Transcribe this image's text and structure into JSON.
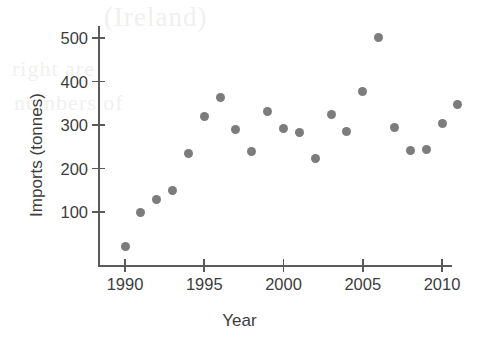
{
  "chart_data": {
    "type": "scatter",
    "title": "",
    "xlabel": "Year",
    "ylabel": "Imports (tonnes)",
    "xlim": [
      1989.0,
      2012.0
    ],
    "ylim": [
      0,
      540
    ],
    "xticks": [
      1990,
      1995,
      2000,
      2005,
      2010
    ],
    "yticks": [
      100,
      200,
      300,
      400,
      500
    ],
    "xtick_labels": [
      "1990",
      "1995",
      "2000",
      "2005",
      "2010"
    ],
    "ytick_labels": [
      "100",
      "200",
      "300",
      "400",
      "500"
    ],
    "grid": false,
    "legend": null,
    "marker": {
      "shape": "circle",
      "color": "#7c7c7c",
      "size_px": 9
    },
    "x": [
      1990,
      1991,
      1992,
      1993,
      1994,
      1995,
      1996,
      1997,
      1998,
      1999,
      2000,
      2001,
      2002,
      2003,
      2004,
      2005,
      2006,
      2007,
      2008,
      2009,
      2010,
      2011
    ],
    "values": [
      20,
      100,
      128,
      150,
      235,
      320,
      363,
      290,
      240,
      332,
      292,
      283,
      223,
      325,
      286,
      376,
      502,
      294,
      241,
      243,
      304,
      347
    ],
    "points": [
      {
        "year": 1990,
        "imports": 20
      },
      {
        "year": 1991,
        "imports": 100
      },
      {
        "year": 1992,
        "imports": 128
      },
      {
        "year": 1993,
        "imports": 150
      },
      {
        "year": 1994,
        "imports": 235
      },
      {
        "year": 1995,
        "imports": 320
      },
      {
        "year": 1996,
        "imports": 363
      },
      {
        "year": 1997,
        "imports": 290
      },
      {
        "year": 1998,
        "imports": 240
      },
      {
        "year": 1999,
        "imports": 332
      },
      {
        "year": 2000,
        "imports": 292
      },
      {
        "year": 2001,
        "imports": 283
      },
      {
        "year": 2002,
        "imports": 223
      },
      {
        "year": 2003,
        "imports": 325
      },
      {
        "year": 2004,
        "imports": 286
      },
      {
        "year": 2005,
        "imports": 376
      },
      {
        "year": 2006,
        "imports": 502
      },
      {
        "year": 2007,
        "imports": 294
      },
      {
        "year": 2008,
        "imports": 241
      },
      {
        "year": 2009,
        "imports": 243
      },
      {
        "year": 2010,
        "imports": 304
      },
      {
        "year": 2011,
        "imports": 347
      }
    ]
  },
  "background_bleed": {
    "line1": "(Ireland)",
    "line2": "right are",
    "line3": "numbers of",
    "line4": ""
  }
}
